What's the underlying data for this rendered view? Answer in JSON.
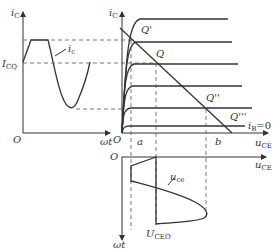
{
  "diagram": {
    "left_plot": {
      "y_axis_label": "i",
      "y_axis_sub": "C",
      "x_axis_label": "ωt",
      "origin_label": "O",
      "level_label": "I",
      "level_sub": "CQ",
      "curve_label": "i",
      "curve_sub": "c"
    },
    "right_plot": {
      "y_axis_label": "i",
      "y_axis_sub": "C",
      "x_axis_label": "u",
      "x_axis_sub": "CE",
      "origin_label": "O",
      "points": [
        "Q'",
        "Q",
        "Q''",
        "Q'''"
      ],
      "ib_label": "i",
      "ib_sub": "B",
      "ib_value": "=0",
      "tick_a": "a",
      "tick_b": "b"
    },
    "bottom_plot": {
      "origin_label": "O",
      "x_axis_label": "u",
      "x_axis_sub": "CE",
      "y_axis_label": "ωt",
      "curve_label": "u",
      "curve_sub": "ce",
      "level_label": "U",
      "level_sub": "CEO"
    }
  }
}
